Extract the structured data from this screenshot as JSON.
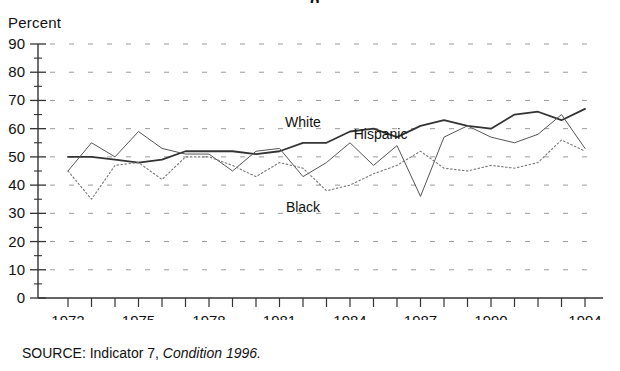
{
  "figure": {
    "title_partial": "g                                    ",
    "y_axis_caption": "Percent",
    "x_axis_title": "Year",
    "source_prefix": "SOURCE:",
    "source_text": "Indicator 7,",
    "source_italic": "Condition 1996."
  },
  "chart_data": {
    "type": "line",
    "title": "",
    "xlabel": "Year",
    "ylabel": "Percent",
    "ylim": [
      0,
      90
    ],
    "xlim": [
      1972,
      1994
    ],
    "grid": true,
    "grid_style": "dashed-horizontal",
    "legend": "inline-labels",
    "ytick_labels": [
      "0",
      "10",
      "20",
      "30",
      "40",
      "50",
      "60",
      "70",
      "80",
      "90"
    ],
    "ytick_values": [
      0,
      10,
      20,
      30,
      40,
      50,
      60,
      70,
      80,
      90
    ],
    "yminor_step": 5,
    "xtick_labels": [
      "1972",
      "1975",
      "1978",
      "1981",
      "1984",
      "1987",
      "1990",
      "1994"
    ],
    "xtick_label_values": [
      1972,
      1975,
      1978,
      1981,
      1984,
      1987,
      1990,
      1994
    ],
    "x": [
      1972,
      1973,
      1974,
      1975,
      1976,
      1977,
      1978,
      1979,
      1980,
      1981,
      1982,
      1983,
      1984,
      1985,
      1986,
      1987,
      1988,
      1989,
      1990,
      1991,
      1992,
      1993,
      1994
    ],
    "series": [
      {
        "name": "White",
        "label": "White",
        "style": "solid",
        "color": "#333333",
        "width": 1.8,
        "label_x": 1982.0,
        "label_y": 60.5,
        "values": [
          50,
          50,
          49,
          48,
          49,
          52,
          52,
          52,
          51,
          52,
          55,
          55,
          59,
          60,
          57,
          61,
          63,
          61,
          60,
          65,
          66,
          63,
          67
        ]
      },
      {
        "name": "Hispanic",
        "label": "Hispanic",
        "style": "thin-solid",
        "color": "#555555",
        "width": 1.0,
        "label_x": 1985.3,
        "label_y": 56.5,
        "values": [
          45,
          55,
          50,
          59,
          53,
          51,
          51,
          45,
          52,
          53,
          43,
          48,
          55,
          47,
          54,
          36,
          57,
          61,
          57,
          55,
          58,
          65,
          53
        ]
      },
      {
        "name": "Black",
        "label": "Black",
        "style": "dotted",
        "color": "#777777",
        "width": 1.1,
        "label_x": 1982.0,
        "label_y": 30.5,
        "values": [
          45,
          35,
          47,
          48,
          42,
          50,
          50,
          47,
          43,
          48,
          46,
          38,
          40,
          44,
          47,
          52,
          46,
          45,
          47,
          46,
          48,
          56,
          52
        ]
      }
    ]
  }
}
